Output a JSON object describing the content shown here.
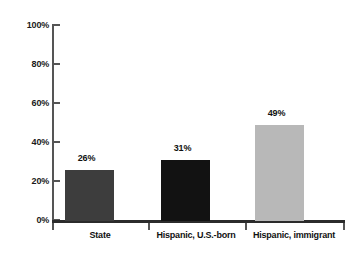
{
  "chart_data": {
    "type": "bar",
    "title": "",
    "subtitle": "",
    "xlabel": "",
    "ylabel": "",
    "categories": [
      "State",
      "Hispanic, U.S.-born",
      "Hispanic, immigrant"
    ],
    "values": [
      26,
      31,
      49
    ],
    "value_labels": [
      "26%",
      "31%",
      "49%"
    ],
    "ylim": [
      0,
      100
    ],
    "ytick_labels": [
      "100%",
      "80%",
      "60%",
      "40%",
      "20%",
      "0%"
    ],
    "ytick_values": [
      100,
      80,
      60,
      40,
      20,
      0
    ],
    "grid": false,
    "legend": false,
    "bar_colors": [
      "#3d3d3d",
      "#121212",
      "#b8b8b8"
    ],
    "axis_color": "#2b2b2b",
    "background": "#ffffff"
  }
}
